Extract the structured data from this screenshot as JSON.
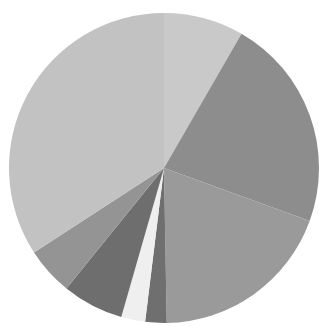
{
  "chart": {
    "title": "",
    "subtitle": "",
    "legend_visible": false,
    "labels_visible": false,
    "background_color": "#ffffff"
  },
  "geometry": {
    "center_x": 164,
    "center_y": 168,
    "radius": 155,
    "start_angle_deg": -90,
    "direction": "clockwise"
  },
  "chart_data": {
    "type": "pie",
    "title": "",
    "xlabel": "",
    "ylabel": "",
    "legend_position": "none",
    "grid": false,
    "categories": [
      "Slice 1",
      "Slice 2",
      "Slice 3",
      "Slice 4",
      "Slice 5",
      "Slice 6",
      "Slice 7",
      "Slice 8"
    ],
    "values": [
      6.1,
      16.5,
      14.2,
      1.6,
      1.9,
      4.7,
      3.6,
      22.0
    ],
    "percentages": [
      8.3,
      22.3,
      19.2,
      2.2,
      2.6,
      6.4,
      4.9,
      34.1
    ],
    "angles_deg": [
      30.0,
      80.0,
      69.0,
      8.0,
      9.0,
      23.0,
      18.0,
      123.0
    ],
    "colors": [
      "#c9c9c9",
      "#8d8d8d",
      "#9a9a9a",
      "#6f6f6f",
      "#efefef",
      "#6e6e6e",
      "#949494",
      "#c2c2c2"
    ],
    "slices": [
      {
        "label": "Slice 1",
        "value": 6.1,
        "percent": 8.3,
        "angle": 30.0,
        "color": "#c9c9c9"
      },
      {
        "label": "Slice 2",
        "value": 16.5,
        "percent": 22.3,
        "angle": 80.0,
        "color": "#8d8d8d"
      },
      {
        "label": "Slice 3",
        "value": 14.2,
        "percent": 19.2,
        "angle": 69.0,
        "color": "#9a9a9a"
      },
      {
        "label": "Slice 4",
        "value": 1.6,
        "percent": 2.2,
        "angle": 8.0,
        "color": "#6f6f6f"
      },
      {
        "label": "Slice 5",
        "value": 1.9,
        "percent": 2.6,
        "angle": 9.0,
        "color": "#efefef"
      },
      {
        "label": "Slice 6",
        "value": 4.7,
        "percent": 6.4,
        "angle": 23.0,
        "color": "#6e6e6e"
      },
      {
        "label": "Slice 7",
        "value": 3.6,
        "percent": 4.9,
        "angle": 18.0,
        "color": "#949494"
      },
      {
        "label": "Slice 8",
        "value": 22.0,
        "percent": 34.1,
        "angle": 123.0,
        "color": "#c2c2c2"
      }
    ],
    "total": 70.6,
    "dark_wedge_color": "#7f7f7f",
    "dark_wedge_label": "Slice 9",
    "dark_wedge_angle": 0
  }
}
